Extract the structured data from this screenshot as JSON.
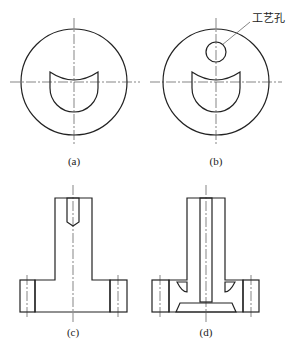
{
  "figure": {
    "top_caption_partial": "",
    "bottom_caption_partial": "",
    "panels": [
      {
        "id": "a",
        "label": "(a)",
        "view": "circular cross-section with crescent cavity"
      },
      {
        "id": "b",
        "label": "(b)",
        "view": "circular cross-section with crescent cavity and process hole",
        "callout": "工艺孔"
      },
      {
        "id": "c",
        "label": "(c)",
        "view": "T-shaped section with blind hole"
      },
      {
        "id": "d",
        "label": "(d)",
        "view": "T-shaped section with through bore and undercut cavity"
      }
    ]
  },
  "colors": {
    "line": "#222222",
    "background": "#ffffff"
  }
}
